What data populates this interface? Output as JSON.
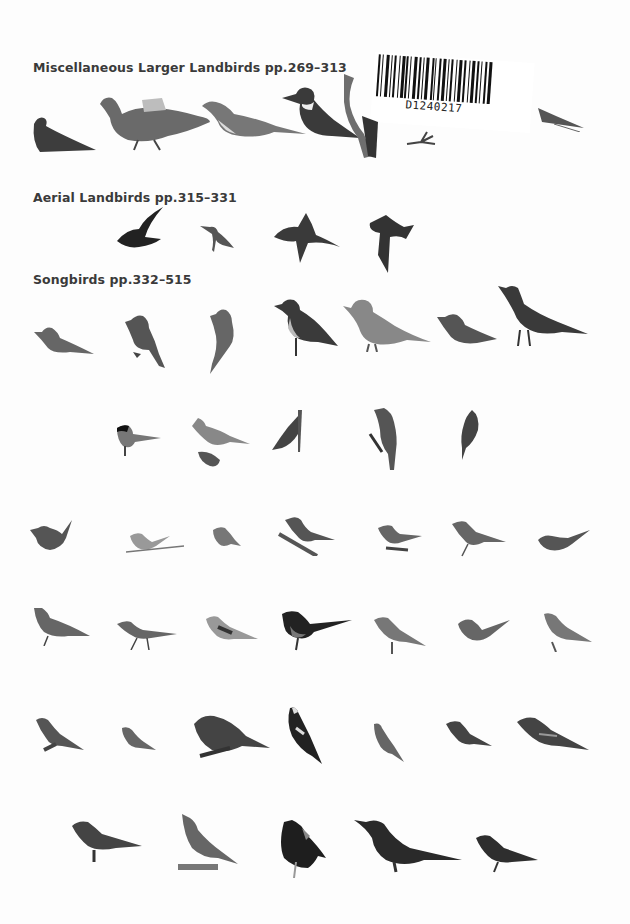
{
  "page": {
    "background": "#fdfdfd",
    "ink_color": "#3a3a3a"
  },
  "sections": [
    {
      "id": "misc",
      "title": "Miscellaneous Larger Landbirds pp.269–313"
    },
    {
      "id": "aerial",
      "title": "Aerial Landbirds pp.315–331"
    },
    {
      "id": "songbirds",
      "title": "Songbirds pp.332–515"
    }
  ],
  "library_sticker": {
    "barcode_number": "D1240217"
  },
  "bird_groups": {
    "misc_row": [
      "nightjar",
      "pigeon",
      "cuckoo",
      "kingfisher",
      "woodpecker",
      "woodpecker-foot",
      "partial-bird-tail"
    ],
    "aerial_row": [
      "swift",
      "hummingbird",
      "swallow",
      "martin"
    ],
    "songbird_rows": [
      [
        "pewee",
        "phoebe",
        "flycatcher",
        "kingbird",
        "mockingbird",
        "shrike",
        "robin"
      ],
      [
        "chickadee",
        "titmouse",
        "nuthatch",
        "waxwing",
        "creeper"
      ],
      [
        "wren",
        "gnatcatcher",
        "kinglet",
        "thrush",
        "bluebird",
        "thrasher",
        "warbler"
      ],
      [
        "longspur",
        "pipit",
        "bunting",
        "towhee",
        "sparrow",
        "junco",
        "house-sparrow"
      ],
      [
        "cardinal-female",
        "goldfinch",
        "grosbeak",
        "bobolink",
        "finch",
        "crossbill",
        "oriole"
      ],
      [
        "starling",
        "meadowlark",
        "blackbird",
        "grackle",
        "cowbird"
      ]
    ]
  }
}
